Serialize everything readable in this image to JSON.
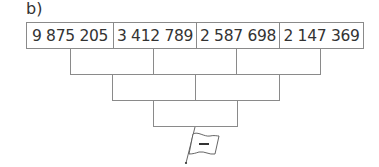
{
  "exercise_label": "b)",
  "pyramid": {
    "top_row": [
      "9 875 205",
      "3 412 789",
      "2 587 698",
      "2 147 369"
    ],
    "row2": [
      "",
      "",
      ""
    ],
    "row3": [
      "",
      ""
    ],
    "row4": [
      ""
    ]
  },
  "flag": {
    "symbol": "−",
    "icon": "flag-minus-icon"
  }
}
